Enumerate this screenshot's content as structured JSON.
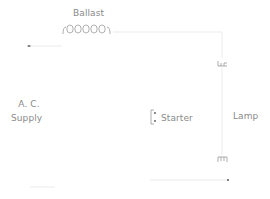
{
  "diagram": {
    "title": "",
    "labels": {
      "ballast": "Ballast",
      "ac_line1": "A. C.",
      "ac_line2": "Supply",
      "starter": "Starter",
      "lamp": "Lamp"
    },
    "components": [
      {
        "id": "ballast",
        "type": "inductor-coil",
        "turns": 5
      },
      {
        "id": "ac-supply",
        "type": "source"
      },
      {
        "id": "starter",
        "type": "switch-bracket"
      },
      {
        "id": "lamp",
        "type": "fluorescent-tube",
        "filaments": 2
      }
    ],
    "colors": {
      "line": "#cfcfcf",
      "text": "#8a8a8a",
      "component": "#9a9a9a"
    }
  }
}
